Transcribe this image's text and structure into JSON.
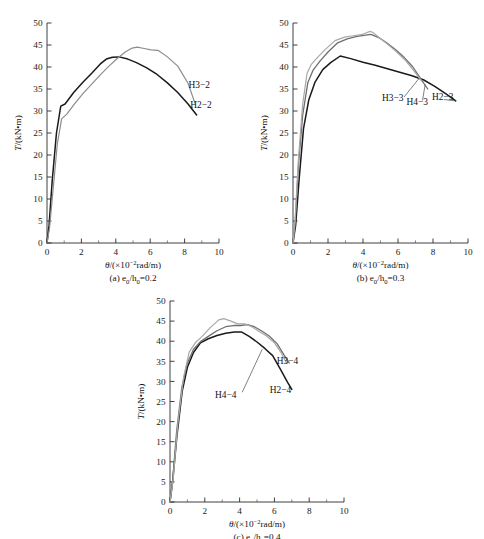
{
  "figure": {
    "background_color": "#ffffff",
    "axis_color": "#2b2b2b",
    "text_color": "#111111"
  },
  "axis_titles": {
    "x_symbol": "θ",
    "x_prefix": "/(×10",
    "x_exponent": "−2",
    "x_suffix": "rad/m)",
    "y_symbol": "T",
    "y_rest": "/(kN•m)"
  },
  "shared_axes": {
    "x_min": 0,
    "x_max": 10,
    "y_min": 0,
    "y_max": 50,
    "x_major_ticks": [
      0,
      2,
      4,
      6,
      8,
      10
    ],
    "x_minor_ticks": [
      1,
      3,
      5,
      7,
      9
    ],
    "y_major_ticks": [
      0,
      5,
      10,
      15,
      20,
      25,
      30,
      35,
      40,
      45,
      50
    ],
    "x_tick_labels": [
      "0",
      "2",
      "4",
      "6",
      "8",
      "10"
    ],
    "y_tick_labels": [
      "0",
      "5",
      "10",
      "15",
      "20",
      "25",
      "30",
      "35",
      "40",
      "45",
      "50"
    ],
    "grid": false,
    "legend_position": "inline-annotations"
  },
  "chart_data": [
    {
      "id": "a",
      "type": "line",
      "title": "",
      "caption_prefix": "(a) ",
      "caption_symbol": "e",
      "caption_sub1": "0",
      "caption_mid": "/h",
      "caption_sub2": "0",
      "caption_value": "=0.2",
      "caption_plain": "(a) e0/h0=0.2",
      "xlabel": "θ/(×10−2rad/m)",
      "ylabel": "T/(kN•m)",
      "xlim": [
        0,
        10
      ],
      "ylim": [
        0,
        50
      ],
      "series": [
        {
          "name": "H2-2",
          "label": "H2−2",
          "color": "#1a1a1a",
          "width": 1.5,
          "label_x": 8.95,
          "label_y": 30.6,
          "leader": null,
          "x": [
            0.0,
            0.12,
            0.3,
            0.55,
            0.8,
            1.05,
            1.55,
            2.1,
            2.6,
            3.1,
            3.45,
            3.8,
            4.2,
            4.7,
            5.2,
            5.8,
            6.4,
            7.0,
            7.6,
            8.2,
            8.7
          ],
          "y": [
            0.0,
            4.0,
            14.0,
            25.0,
            31.1,
            31.6,
            34.2,
            36.6,
            38.6,
            40.7,
            41.8,
            42.2,
            42.3,
            41.8,
            41.0,
            39.8,
            38.3,
            36.4,
            34.2,
            31.6,
            29.1
          ]
        },
        {
          "name": "H3-2",
          "label": "H3−2",
          "color": "#8c8c8c",
          "width": 1.2,
          "label_x": 8.85,
          "label_y": 35.3,
          "leader": null,
          "x": [
            0.0,
            0.15,
            0.35,
            0.6,
            0.85,
            1.15,
            1.6,
            2.1,
            2.6,
            3.1,
            3.6,
            4.1,
            4.55,
            4.95,
            5.25,
            5.65,
            6.05,
            6.45,
            7.0,
            7.6,
            8.2,
            8.6
          ],
          "y": [
            0.0,
            3.5,
            12.0,
            22.5,
            28.2,
            29.3,
            31.6,
            34.0,
            36.1,
            38.2,
            40.2,
            42.0,
            43.4,
            44.3,
            44.5,
            44.2,
            43.9,
            43.8,
            42.3,
            40.2,
            36.3,
            31.8
          ]
        }
      ]
    },
    {
      "id": "b",
      "type": "line",
      "title": "",
      "caption_prefix": "(b) ",
      "caption_symbol": "e",
      "caption_sub1": "0",
      "caption_mid": "/h",
      "caption_sub2": "0",
      "caption_value": "=0.3",
      "caption_plain": "(b) e0/h0=0.3",
      "xlabel": "θ/(×10−2rad/m)",
      "ylabel": "T/(kN•m)",
      "xlim": [
        0,
        10
      ],
      "ylim": [
        0,
        50
      ],
      "series": [
        {
          "name": "H2-3",
          "label": "H2−3",
          "color": "#1a1a1a",
          "width": 1.5,
          "label_x": 8.55,
          "label_y": 32.6,
          "leader": {
            "x1": 9.3,
            "y1": 32.3,
            "x2": 8.62,
            "y2": 32.6
          },
          "x": [
            0.0,
            0.15,
            0.35,
            0.6,
            0.9,
            1.25,
            1.7,
            2.15,
            2.7,
            3.3,
            4.0,
            4.7,
            5.4,
            6.1,
            6.8,
            7.45,
            8.1,
            8.7,
            9.3
          ],
          "y": [
            0.0,
            4.0,
            14.5,
            26.0,
            32.5,
            36.5,
            39.4,
            41.0,
            42.5,
            41.9,
            41.1,
            40.4,
            39.6,
            38.8,
            38.0,
            37.1,
            35.6,
            34.0,
            32.3
          ]
        },
        {
          "name": "H4-3",
          "label": "H4−3",
          "color": "#6e6e6e",
          "width": 1.3,
          "label_x": 7.1,
          "label_y": 31.4,
          "leader": {
            "x1": 7.55,
            "y1": 36.0,
            "x2": 7.4,
            "y2": 32.4
          },
          "x": [
            0.0,
            0.12,
            0.3,
            0.55,
            0.85,
            1.15,
            1.55,
            2.0,
            2.55,
            3.1,
            3.6,
            4.05,
            4.45,
            4.9,
            5.35,
            5.85,
            6.35,
            6.85,
            7.35,
            7.7
          ],
          "y": [
            0.0,
            4.5,
            17.0,
            29.0,
            36.5,
            39.3,
            41.4,
            43.4,
            45.5,
            46.4,
            46.9,
            47.2,
            47.4,
            46.7,
            45.5,
            44.0,
            42.2,
            40.0,
            37.0,
            35.0
          ]
        },
        {
          "name": "H3-3",
          "label": "H3−3",
          "color": "#a8a8a8",
          "width": 1.2,
          "label_x": 5.7,
          "label_y": 32.2,
          "leader": {
            "x1": 7.2,
            "y1": 37.4,
            "x2": 6.35,
            "y2": 33.2
          },
          "x": [
            0.0,
            0.12,
            0.3,
            0.55,
            0.8,
            1.05,
            1.4,
            1.85,
            2.4,
            2.95,
            3.45,
            3.95,
            4.4,
            4.55,
            4.95,
            5.4,
            5.9,
            6.4,
            6.9,
            7.35
          ],
          "y": [
            0.0,
            5.0,
            18.5,
            31.5,
            38.5,
            40.6,
            42.2,
            44.0,
            46.0,
            46.8,
            47.1,
            47.4,
            48.1,
            47.9,
            46.6,
            45.2,
            43.5,
            41.6,
            39.2,
            36.8
          ]
        }
      ]
    },
    {
      "id": "c",
      "type": "line",
      "title": "",
      "caption_prefix": "(c) ",
      "caption_symbol": "e",
      "caption_sub1": "0",
      "caption_mid": "/h",
      "caption_sub2": "0",
      "caption_value": "=0.4",
      "caption_plain": "(c) e0/h0=0.4",
      "xlabel": "θ/(×10−2rad/m)",
      "ylabel": "T/(kN•m)",
      "xlim": [
        0,
        10
      ],
      "ylim": [
        0,
        50
      ],
      "series": [
        {
          "name": "H2-4",
          "label": "H2−4",
          "color": "#1a1a1a",
          "width": 1.5,
          "label_x": 6.35,
          "label_y": 27.2,
          "leader": null,
          "x": [
            0.0,
            0.15,
            0.4,
            0.7,
            1.0,
            1.35,
            1.75,
            2.2,
            2.7,
            3.2,
            3.7,
            4.1,
            4.55,
            5.0,
            5.45,
            5.9,
            6.35,
            6.75,
            7.0
          ],
          "y": [
            0.0,
            5.0,
            16.5,
            27.5,
            33.5,
            37.2,
            39.6,
            40.6,
            41.4,
            42.0,
            42.3,
            42.3,
            41.2,
            39.8,
            38.2,
            36.4,
            33.0,
            29.8,
            28.0
          ]
        },
        {
          "name": "H4-4",
          "label": "H4−4",
          "color": "#6e6e6e",
          "width": 1.3,
          "label_x": 3.2,
          "label_y": 25.8,
          "leader": {
            "x1": 5.3,
            "y1": 38.0,
            "x2": 4.15,
            "y2": 27.3
          },
          "x": [
            0.0,
            0.15,
            0.38,
            0.68,
            1.0,
            1.35,
            1.75,
            2.2,
            2.7,
            3.2,
            3.65,
            4.05,
            4.45,
            4.85,
            5.25,
            5.7,
            6.15,
            6.55,
            6.85
          ],
          "y": [
            0.0,
            5.2,
            17.5,
            28.5,
            34.6,
            38.0,
            39.9,
            41.2,
            42.6,
            43.6,
            43.9,
            43.9,
            44.1,
            43.6,
            42.6,
            41.3,
            39.4,
            36.6,
            34.6
          ]
        },
        {
          "name": "H3-4",
          "label": "H3−4",
          "color": "#a8a8a8",
          "width": 1.2,
          "label_x": 6.75,
          "label_y": 34.3,
          "leader": null,
          "x": [
            0.0,
            0.18,
            0.45,
            0.78,
            1.1,
            1.45,
            1.85,
            2.3,
            2.8,
            3.1,
            3.5,
            3.9,
            4.3,
            4.7,
            5.1,
            5.55,
            6.0,
            6.4,
            6.7
          ],
          "y": [
            0.0,
            5.5,
            19.5,
            31.0,
            37.3,
            39.6,
            41.2,
            43.3,
            45.3,
            45.6,
            45.0,
            44.3,
            44.3,
            43.6,
            42.5,
            41.3,
            39.6,
            37.0,
            34.5
          ]
        }
      ]
    }
  ]
}
